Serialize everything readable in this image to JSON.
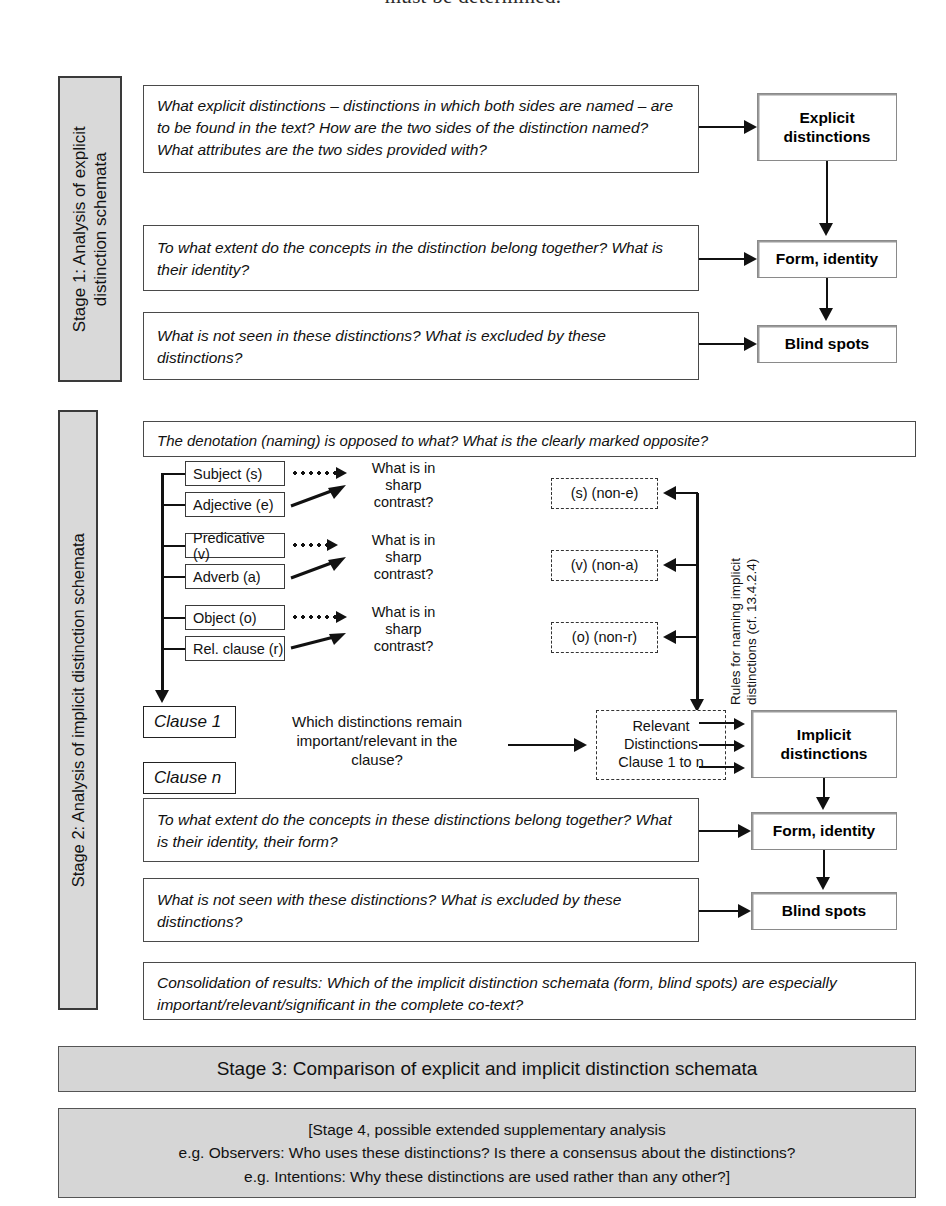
{
  "page": {
    "cut_off_running_text": "must be determined."
  },
  "stage1": {
    "label_line1": "Stage 1: Analysis of explicit",
    "label_line2": "distinction schemata",
    "questions": [
      "What explicit distinctions – distinctions in which both sides are named – are to be found in the text? How are the two sides of the distinction named? What attributes are the two sides provided with?",
      "To what extent do the concepts in the distinction belong together? What is their identity?",
      "What is not seen in these distinctions? What is excluded by these distinctions?"
    ],
    "results": [
      {
        "line1": "Explicit",
        "line2": "distinctions"
      },
      {
        "line1": "Form, identity",
        "line2": ""
      },
      {
        "line1": "Blind spots",
        "line2": ""
      }
    ]
  },
  "stage2": {
    "label": "Stage 2: Analysis of implicit distinction schemata",
    "top_question": "The denotation (naming) is opposed to what? What is the clearly marked opposite?",
    "constituents": [
      {
        "label": "Subject (s)",
        "connector": "dotted"
      },
      {
        "label": "Adjective (e)",
        "connector": "solid"
      },
      {
        "label": "Predicative (v)",
        "connector": "dotted"
      },
      {
        "label": "Adverb (a)",
        "connector": "solid"
      },
      {
        "label": "Object (o)",
        "connector": "dotted"
      },
      {
        "label": "Rel. clause (r)",
        "connector": "solid"
      }
    ],
    "contrast_prompts": [
      "What is in\nsharp\ncontrast?",
      "What is in\nsharp\ncontrast?",
      "What is in\nsharp\ncontrast?"
    ],
    "contrast_prompt_lines": [
      "What is in",
      "sharp",
      "contrast?"
    ],
    "implicit_pairs": [
      "(s) (non-e)",
      "(v) (non-a)",
      "(o) (non-r)"
    ],
    "rules_caption_line1": "Rules for naming implicit",
    "rules_caption_line2": "distinctions (cf. 13.4.2.4)",
    "clauses": [
      "Clause 1",
      "Clause n"
    ],
    "clause_question_lines": [
      "Which distinctions remain",
      "important/relevant in the",
      "clause?"
    ],
    "relevant_box_lines": [
      "Relevant",
      "Distinctions",
      "Clause 1 to n"
    ],
    "questions": [
      "To what extent do the concepts in these distinctions belong together? What is their identity, their form?",
      "What is not seen with these distinctions? What is excluded by these distinctions?"
    ],
    "consolidation": "Consolidation of results: Which of the implicit distinction schemata (form, blind spots) are especially important/relevant/significant in the complete co-text?",
    "results": [
      {
        "line1": "Implicit",
        "line2": "distinctions"
      },
      {
        "line1": "Form, identity",
        "line2": ""
      },
      {
        "line1": "Blind spots",
        "line2": ""
      }
    ]
  },
  "stage3": {
    "banner": "Stage 3: Comparison of explicit and implicit distinction schemata"
  },
  "stage4": {
    "lines": [
      "[Stage 4, possible extended supplementary analysis",
      "e.g. Observers: Who uses these distinctions? Is there a consensus about the distinctions?",
      "e.g. Intentions: Why these distinctions are used rather than any other?]"
    ]
  },
  "colors": {
    "stage_label_fill": "#d9d9d9",
    "banner_fill": "#d6d6d6",
    "stroke": "#3a3a3a",
    "text": "#111111"
  }
}
